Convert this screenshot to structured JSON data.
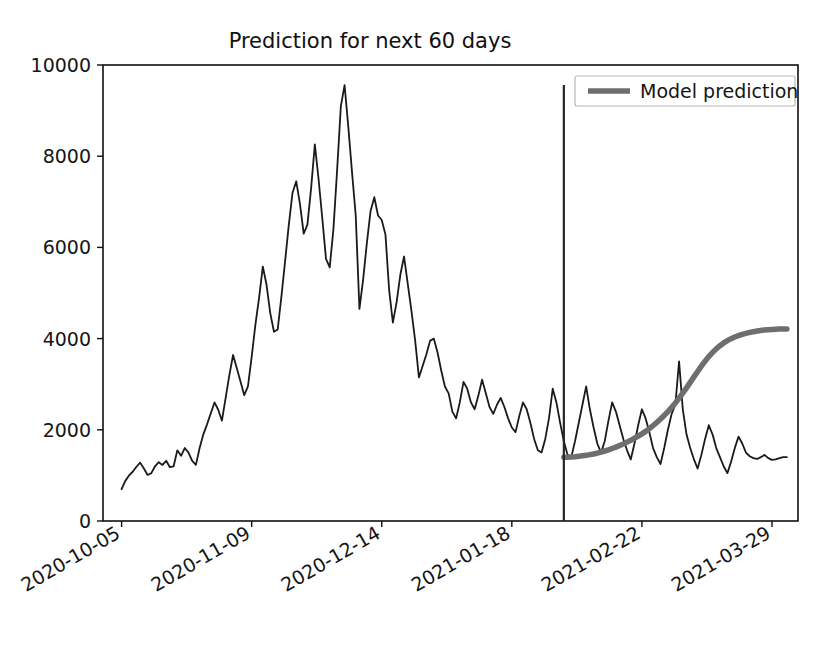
{
  "chart_data": {
    "type": "line",
    "title": "Prediction for next 60 days",
    "xlabel": "",
    "ylabel": "",
    "ylim": [
      0,
      10000
    ],
    "grid": false,
    "legend_position": "top-right",
    "yticks": [
      "0",
      "2000",
      "4000",
      "6000",
      "8000",
      "10000"
    ],
    "ytick_values": [
      0,
      2000,
      4000,
      6000,
      8000,
      10000
    ],
    "xticks": [
      "2020-10-05",
      "2020-11-09",
      "2020-12-14",
      "2021-01-18",
      "2021-02-22",
      "2021-03-29"
    ],
    "xtick_days": [
      0,
      35,
      70,
      105,
      140,
      175
    ],
    "xlim_days": [
      -5,
      182
    ],
    "forecast_divider_day": 119,
    "forecast_divider_date": "2021-02-01",
    "series": [
      {
        "name": "Historical",
        "color": "#1a1a1a",
        "style": "thin-solid",
        "in_legend": false,
        "start_day": 0,
        "values": [
          700,
          880,
          1000,
          1080,
          1190,
          1280,
          1150,
          1010,
          1050,
          1200,
          1290,
          1230,
          1320,
          1180,
          1200,
          1550,
          1430,
          1600,
          1500,
          1320,
          1230,
          1600,
          1900,
          2120,
          2360,
          2600,
          2440,
          2200,
          2700,
          3200,
          3640,
          3350,
          3060,
          2760,
          2950,
          3600,
          4300,
          4900,
          5580,
          5180,
          4560,
          4150,
          4200,
          4920,
          5700,
          6500,
          7200,
          7450,
          6950,
          6300,
          6500,
          7300,
          8260,
          7500,
          6640,
          5750,
          5560,
          6400,
          7700,
          9100,
          9560,
          8650,
          7650,
          6700,
          4650,
          5300,
          6100,
          6800,
          7100,
          6700,
          6600,
          6280,
          5050,
          4350,
          4800,
          5400,
          5800,
          5200,
          4600,
          3950,
          3150,
          3400,
          3650,
          3950,
          4000,
          3700,
          3300,
          2950,
          2800,
          2400,
          2250,
          2600,
          3050,
          2900,
          2600,
          2450,
          2750,
          3100,
          2800,
          2500,
          2350,
          2550,
          2700,
          2500,
          2250,
          2050,
          1950,
          2300,
          2600,
          2450,
          2150,
          1800,
          1550,
          1500,
          1800,
          2250,
          2900,
          2600,
          2150,
          1750,
          1450,
          1400,
          1750,
          2150,
          2550,
          2950,
          2450,
          2050,
          1700,
          1500,
          1750,
          2200,
          2600,
          2400,
          2100,
          1800,
          1550,
          1350,
          1700,
          2100,
          2450,
          2250,
          1950,
          1600,
          1400,
          1250,
          1600,
          2000,
          2350,
          2550,
          3500,
          2450,
          1900,
          1600,
          1350,
          1150,
          1450,
          1800,
          2100,
          1900,
          1600,
          1400,
          1200,
          1050,
          1300,
          1600,
          1850,
          1700,
          1500,
          1420,
          1380,
          1360,
          1400,
          1450,
          1380,
          1340,
          1350,
          1380,
          1400,
          1400
        ]
      },
      {
        "name": "Model prediction",
        "color": "#6e6e6e",
        "style": "thick-solid",
        "in_legend": true,
        "start_day": 119,
        "values": [
          1400,
          1400,
          1405,
          1410,
          1420,
          1430,
          1440,
          1455,
          1470,
          1490,
          1510,
          1535,
          1560,
          1590,
          1620,
          1655,
          1690,
          1730,
          1770,
          1815,
          1860,
          1910,
          1965,
          2025,
          2090,
          2160,
          2235,
          2315,
          2400,
          2490,
          2590,
          2695,
          2805,
          2920,
          3040,
          3160,
          3280,
          3395,
          3505,
          3605,
          3695,
          3775,
          3845,
          3905,
          3955,
          3998,
          4035,
          4065,
          4092,
          4115,
          4135,
          4152,
          4166,
          4178,
          4188,
          4196,
          4202,
          4206,
          4209,
          4210,
          4212
        ]
      }
    ],
    "legend": [
      {
        "label": "Model prediction",
        "color": "#6e6e6e"
      }
    ]
  }
}
